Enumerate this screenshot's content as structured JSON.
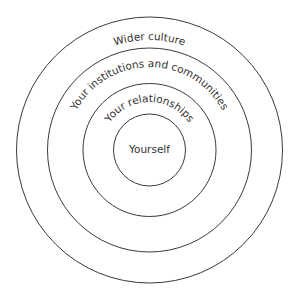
{
  "diagram": {
    "type": "concentric-circles",
    "center": {
      "x": 149.5,
      "y": 150
    },
    "stroke_color": "#3a3a3a",
    "text_color": "#333333",
    "rings": [
      {
        "label": "Wider culture",
        "radius": 133,
        "label_radius": 110
      },
      {
        "label": "Your institutions and communities",
        "radius": 102,
        "label_radius": 83
      },
      {
        "label": "Your relationships",
        "radius": 66.5,
        "label_radius": 48
      },
      {
        "label": "Yourself",
        "radius": 36
      }
    ]
  }
}
